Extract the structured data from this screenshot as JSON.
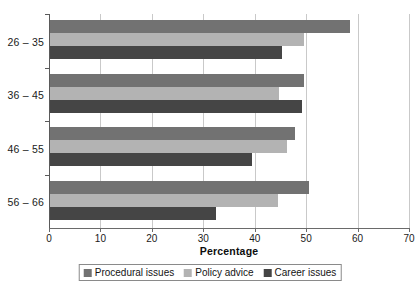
{
  "chart_data": {
    "type": "bar",
    "orientation": "horizontal",
    "title": "",
    "xlabel": "Percentage",
    "ylabel": "",
    "xlim": [
      0,
      70
    ],
    "xticks": [
      0,
      10,
      20,
      30,
      40,
      50,
      60,
      70
    ],
    "xtick_labels": [
      "0",
      "10",
      "20",
      "30",
      "40",
      "50",
      "60",
      "70"
    ],
    "grid": true,
    "grid_axis": "x",
    "legend_position": "bottom",
    "categories": [
      "26 – 35",
      "36 – 45",
      "46 – 55",
      "56 – 66"
    ],
    "series": [
      {
        "name": "Procedural issues",
        "color": "#727272",
        "values": [
          58.5,
          49.5,
          47.8,
          50.5
        ]
      },
      {
        "name": "Policy advice",
        "color": "#b3b3b3",
        "values": [
          49.5,
          44.8,
          46.2,
          44.5
        ]
      },
      {
        "name": "Career issues",
        "color": "#454545",
        "values": [
          45.3,
          49.2,
          39.5,
          32.5
        ]
      }
    ]
  },
  "legend": {
    "items": [
      {
        "label": "Procedural issues",
        "color": "#727272"
      },
      {
        "label": "Policy advice",
        "color": "#b3b3b3"
      },
      {
        "label": "Career issues",
        "color": "#454545"
      }
    ]
  },
  "axis": {
    "x_title": "Percentage"
  }
}
